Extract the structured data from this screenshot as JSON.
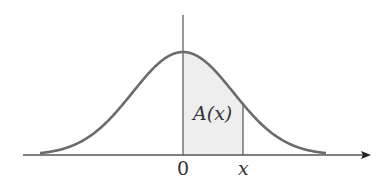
{
  "diagram": {
    "area_label": "A(x)",
    "tick_labels": {
      "origin": "0",
      "x": "x"
    },
    "colors": {
      "curve": "#6b6b6b",
      "axis": "#555555",
      "fill": "#eeeeee",
      "text": "#333333"
    }
  }
}
